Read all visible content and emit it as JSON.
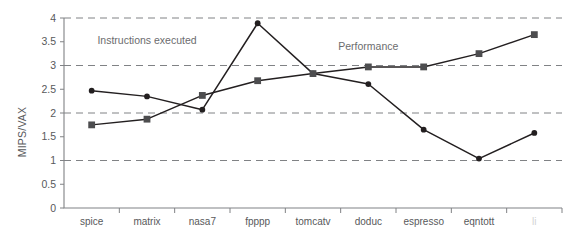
{
  "chart_data": {
    "type": "line",
    "title": "",
    "xlabel": "",
    "ylabel": "MIPS/VAX",
    "ylim": [
      0,
      4
    ],
    "yticks": [
      "0",
      "0.5",
      "1",
      "1.5",
      "2",
      "2.5",
      "3",
      "3.5",
      "4"
    ],
    "ytick_values": [
      0,
      0.5,
      1,
      1.5,
      2,
      2.5,
      3,
      3.5,
      4
    ],
    "gridlines": [
      1,
      2,
      3,
      4
    ],
    "grid": true,
    "legend_position": "inline-annotation",
    "categories": [
      "spice",
      "matrix",
      "nasa7",
      "fpppp",
      "tomcatv",
      "doduc",
      "espresso",
      "eqntott",
      "li"
    ],
    "series": [
      {
        "name": "Instructions executed",
        "marker": "circle",
        "color": "#231f20",
        "values": [
          2.47,
          2.35,
          2.07,
          3.89,
          2.83,
          2.61,
          1.65,
          1.04,
          1.58
        ]
      },
      {
        "name": "Performance",
        "marker": "square",
        "color": "#4d4d4f",
        "values": [
          1.75,
          1.87,
          2.37,
          2.68,
          2.83,
          2.97,
          2.97,
          3.25,
          3.65
        ]
      }
    ],
    "annotations": [
      {
        "text": "Instructions executed",
        "x_category": "matrix",
        "y": 3.45
      },
      {
        "text": "Performance",
        "x_category": "doduc",
        "y": 3.32
      }
    ],
    "faded_labels": [
      "li"
    ]
  }
}
